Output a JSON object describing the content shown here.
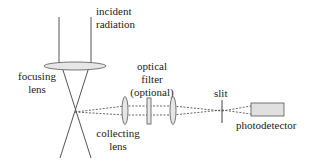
{
  "diagram": {
    "labels": {
      "incident_radiation": [
        "incident",
        "radiation"
      ],
      "focusing_lens": [
        "focusing",
        "lens"
      ],
      "optical_filter": [
        "optical",
        "filter",
        "(optional)"
      ],
      "collecting_lens": [
        "collecting",
        "lens"
      ],
      "slit": "slit",
      "photodetector": "photodetector"
    },
    "colors": {
      "line": "#555555",
      "lens_fill": "#e6e6e6",
      "detector_fill": "#e0e0e0",
      "text": "#222222"
    }
  }
}
